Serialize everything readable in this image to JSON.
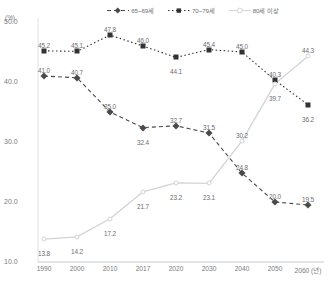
{
  "axis_unit_label": "(%)",
  "legend": [
    {
      "label": "65~69세",
      "marker": "diamond-marker-icon",
      "color": "#4a4a4a",
      "dash": "4 3"
    },
    {
      "label": "70~79세",
      "marker": "square-marker-icon",
      "color": "#333333",
      "dash": "1.5 2.5"
    },
    {
      "label": "80세 이상",
      "marker": "circle-marker-icon",
      "color": "#d2d3d5",
      "dash": "none"
    }
  ],
  "yticks": [
    "50.0",
    "40.0",
    "30.0",
    "20.0",
    "10.0"
  ],
  "xticks": [
    "1990",
    "2000",
    "2010",
    "2017",
    "2020",
    "2030",
    "2040",
    "2050",
    "2060 (년)"
  ],
  "chart_data": {
    "type": "line",
    "title": "",
    "xlabel": "(년)",
    "ylabel": "(%)",
    "ylim": [
      10.0,
      50.0
    ],
    "ytick_values": [
      50.0,
      40.0,
      30.0,
      20.0,
      10.0
    ],
    "grid": false,
    "legend_position": "top-center",
    "categories": [
      "1990",
      "2000",
      "2010",
      "2017",
      "2020",
      "2030",
      "2040",
      "2050",
      "2060"
    ],
    "series": [
      {
        "name": "65~69세",
        "color": "#4a4a4a",
        "marker": "diamond",
        "linestyle": "dashed",
        "values": [
          41.0,
          40.7,
          35.0,
          32.4,
          32.7,
          31.5,
          24.8,
          20.0,
          19.5
        ],
        "labels": [
          "41.0",
          "40.7",
          "35.0",
          "32.4",
          "32.7",
          "31.5",
          "24.8",
          "20.0",
          "19.5"
        ]
      },
      {
        "name": "70~79세",
        "color": "#333333",
        "marker": "square",
        "linestyle": "dotted",
        "values": [
          45.2,
          45.1,
          47.8,
          46.0,
          44.1,
          45.4,
          45.0,
          40.3,
          36.2
        ],
        "labels": [
          "45.2",
          "45.1",
          "47.8",
          "46.0",
          "44.1",
          "45.4",
          "45.0",
          "40.3",
          "36.2"
        ]
      },
      {
        "name": "80세 이상",
        "color": "#d2d3d5",
        "marker": "open-circle",
        "linestyle": "solid",
        "values": [
          13.8,
          14.2,
          17.2,
          21.7,
          23.2,
          23.1,
          30.2,
          39.7,
          44.3
        ],
        "labels": [
          "13.8",
          "14.2",
          "17.2",
          "21.7",
          "23.2",
          "23.1",
          "30.2",
          "39.7",
          "44.3"
        ]
      }
    ]
  }
}
